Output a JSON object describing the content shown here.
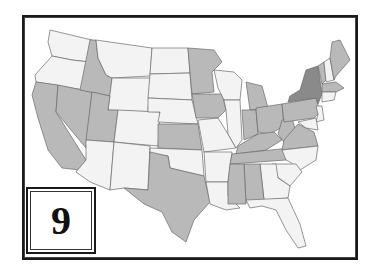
{
  "map": {
    "label_number": "9",
    "colors": {
      "unshaded": "#f3f3f3",
      "shaded": "#b9b9b9",
      "highlight": "#8a8a8a",
      "border": "#6a6a6a"
    },
    "legend": {
      "shaded_states": [
        "CA",
        "NV",
        "ID",
        "UT",
        "KS",
        "TX",
        "MN",
        "IA",
        "MI",
        "IN",
        "OH",
        "KY",
        "TN",
        "WV",
        "VA",
        "PA",
        "MS",
        "AL",
        "ME",
        "VT",
        "MA"
      ],
      "highlight_states": [
        "NY"
      ],
      "unshaded_states": [
        "WA",
        "OR",
        "MT",
        "WY",
        "CO",
        "AZ",
        "NM",
        "ND",
        "SD",
        "NE",
        "OK",
        "MO",
        "AR",
        "LA",
        "WI",
        "IL",
        "GA",
        "FL",
        "SC",
        "NC",
        "NH",
        "NJ",
        "CT",
        "RI",
        "DE",
        "MD"
      ]
    }
  }
}
